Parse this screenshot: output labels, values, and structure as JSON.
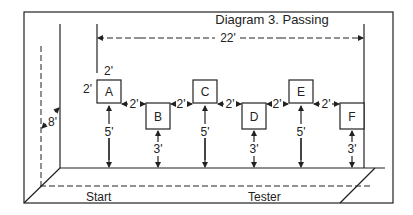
{
  "title": "Diagram 3. Passing",
  "total_width_label": "22'",
  "wall_height_label": "8'",
  "box_size_labels": {
    "top": "2'",
    "side": "2'"
  },
  "spacing_label": "2'",
  "boxes": [
    {
      "label": "A",
      "height_label": "5'",
      "position": "high"
    },
    {
      "label": "B",
      "height_label": "3'",
      "position": "low"
    },
    {
      "label": "C",
      "height_label": "5'",
      "position": "high"
    },
    {
      "label": "D",
      "height_label": "3'",
      "position": "low"
    },
    {
      "label": "E",
      "height_label": "5'",
      "position": "high"
    },
    {
      "label": "F",
      "height_label": "3'",
      "position": "low"
    }
  ],
  "gaps": [
    "2'",
    "2'",
    "2'",
    "2'",
    "2'"
  ],
  "floor_labels": {
    "start": "Start",
    "tester": "Tester"
  },
  "colors": {
    "line": "#222222",
    "background": "#ffffff"
  }
}
